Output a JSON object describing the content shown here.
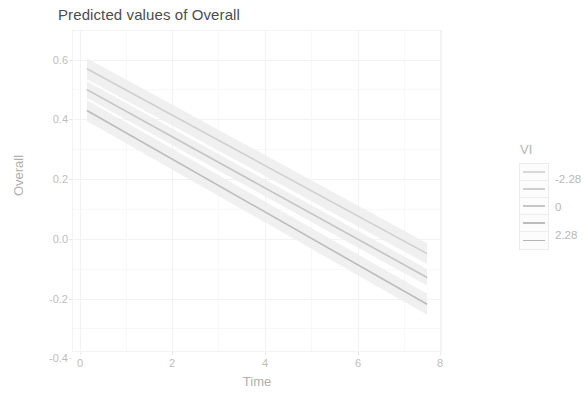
{
  "chart_data": {
    "type": "line",
    "title": "Predicted values of Overall",
    "xlabel": "Time",
    "ylabel": "Overall",
    "xlim": [
      -0.35,
      8.35
    ],
    "ylim": [
      -0.46,
      0.62
    ],
    "x_ticks": [
      "0",
      "2",
      "4",
      "6",
      "8"
    ],
    "x_tick_values": [
      0,
      2,
      4,
      6,
      8
    ],
    "y_ticks": [
      "0.6",
      "0.4",
      "0.2",
      "0.0",
      "-0.2",
      "-0.4"
    ],
    "y_tick_values": [
      0.6,
      0.4,
      0.2,
      0.0,
      -0.2,
      -0.4
    ],
    "grid": true,
    "legend_position": "right",
    "legend_title": "VI",
    "legend_type": "colorbar",
    "legend_labels": [
      "-2.28",
      "0",
      "2.28"
    ],
    "legend_label_values": [
      -2.28,
      0,
      2.28
    ],
    "x": [
      0,
      8
    ],
    "series": [
      {
        "name": "-2.28",
        "color": "#cfcfcf",
        "values": [
          0.49,
          -0.13
        ],
        "ribbon_low": [
          0.455,
          -0.165
        ],
        "ribbon_high": [
          0.525,
          -0.095
        ]
      },
      {
        "name": "0",
        "color": "#c4c4c4",
        "values": [
          0.42,
          -0.21
        ],
        "ribbon_low": [
          0.392,
          -0.238
        ],
        "ribbon_high": [
          0.448,
          -0.182
        ]
      },
      {
        "name": "2.28",
        "color": "#bcbcbc",
        "values": [
          0.35,
          -0.3
        ],
        "ribbon_low": [
          0.315,
          -0.335
        ],
        "ribbon_high": [
          0.385,
          -0.265
        ]
      }
    ],
    "colors": {
      "panel_background": "#ffffff",
      "grid_major": "#f2f2f2",
      "grid_minor": "#f8f8f8",
      "axis_text": "#bdbdbd",
      "axis_title": "#b0b0b0",
      "title_text": "#4d4d4d",
      "ribbon": "#ededed",
      "legend_gradient_low": "#d8d8d8",
      "legend_gradient_high": "#b4b4b4"
    }
  }
}
